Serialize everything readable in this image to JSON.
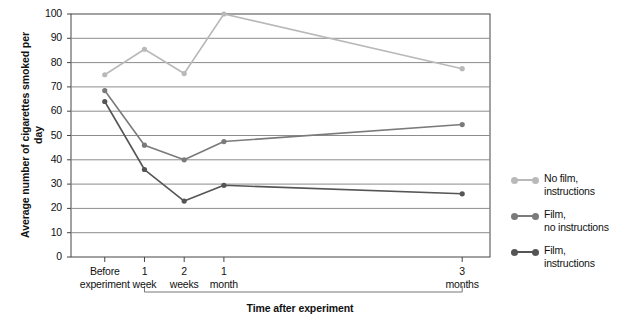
{
  "chart_data": {
    "type": "line",
    "title": "",
    "xlabel": "Time after experiment",
    "ylabel": "Average number of cigarettes smoked per day",
    "categories": [
      "Before experiment",
      "1 week",
      "2 weeks",
      "1 month",
      "3 months"
    ],
    "x_tick_labels": [
      "Before\nexperiment",
      "1\nweek",
      "2\nweeks",
      "1\nmonth",
      "3\nmonths"
    ],
    "x_positions": [
      0,
      1,
      2,
      3,
      9
    ],
    "xlim": [
      -0.85,
      9.7
    ],
    "ylim": [
      0,
      100
    ],
    "y_ticks": [
      0,
      10,
      20,
      30,
      40,
      50,
      60,
      70,
      80,
      90,
      100
    ],
    "grid": "horizontal",
    "legend_position": "right",
    "series": [
      {
        "name": "No film,\ninstructions",
        "color": "#b9b9b9",
        "values": [
          75,
          85.5,
          75.5,
          100,
          77.5
        ]
      },
      {
        "name": "Film,\nno instructions",
        "color": "#7a7a7a",
        "values": [
          68.5,
          46,
          40,
          47.5,
          54.5
        ]
      },
      {
        "name": "Film,\ninstructions",
        "color": "#555555",
        "values": [
          64,
          36,
          23,
          29.5,
          26
        ]
      }
    ]
  },
  "colors": {
    "axis": "#444444",
    "grid": "#8c8c8c",
    "text": "#111111",
    "series_light": "#b9b9b9",
    "series_mid": "#7a7a7a",
    "series_dark": "#555555"
  }
}
